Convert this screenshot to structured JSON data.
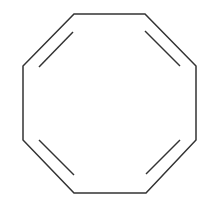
{
  "diagram": {
    "stroke_color": "#333333",
    "background": "#ffffff",
    "ring": {
      "vertices": [
        [
          74,
          14
        ],
        [
          145,
          14
        ],
        [
          196,
          66
        ],
        [
          196,
          140
        ],
        [
          146,
          193
        ],
        [
          74,
          193
        ],
        [
          23,
          140
        ],
        [
          23,
          66
        ]
      ]
    },
    "double_bond_inner_lines": [
      [
        [
          73,
          32
        ],
        [
          39,
          67
        ]
      ],
      [
        [
          145,
          31
        ],
        [
          180,
          66
        ]
      ],
      [
        [
          180,
          140
        ],
        [
          146,
          174
        ]
      ],
      [
        [
          74,
          175
        ],
        [
          39,
          140
        ]
      ]
    ]
  }
}
